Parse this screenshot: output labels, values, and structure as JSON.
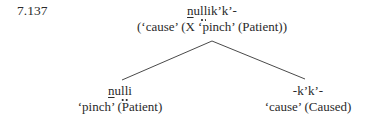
{
  "example_number": "7.137",
  "tree": {
    "root": {
      "form_parts": [
        {
          "text": "n",
          "style": "underline"
        },
        {
          "text": "u",
          "style": "plain"
        },
        {
          "text": "l",
          "style": "dot-under"
        },
        {
          "text": "l",
          "style": "dot-under"
        },
        {
          "text": "ik’k’-",
          "style": "plain"
        }
      ],
      "form_plain": "nullik’k’-",
      "gloss": "(‘cause’ (X ‘pinch’ (Patient))"
    },
    "left_child": {
      "form_parts": [
        {
          "text": "n",
          "style": "underline"
        },
        {
          "text": "u",
          "style": "plain"
        },
        {
          "text": "l",
          "style": "dot-under"
        },
        {
          "text": "l",
          "style": "dot-under"
        },
        {
          "text": "i",
          "style": "plain"
        }
      ],
      "form_plain": "nulli",
      "gloss": "‘pinch’ (Patient)"
    },
    "right_child": {
      "form": "-k’k’-",
      "gloss": "‘cause’ (Caused)"
    }
  }
}
